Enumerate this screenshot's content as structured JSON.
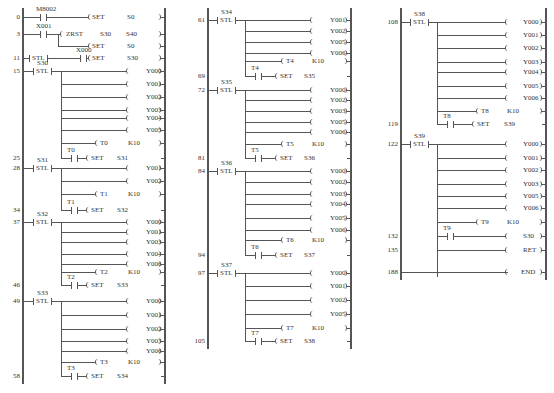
{
  "diagram": {
    "type": "PLC ladder diagram (STL step program)",
    "columns": [
      {
        "rungs": [
          {
            "step": "0",
            "y": 17,
            "contact": {
              "label": "M8002",
              "x": 40
            },
            "coil": "SET",
            "operand": "S0"
          },
          {
            "step": "3",
            "y": 34,
            "contact": {
              "label": "X001",
              "x": 40
            },
            "coil": "ZRST",
            "operand": "S30",
            "operand2": "S40"
          },
          {
            "step": "",
            "y": 46,
            "coil": "SET",
            "operand": "S0",
            "branch": true
          },
          {
            "step": "11",
            "y": 58,
            "stl": {
              "label": ""
            },
            "contact": {
              "label": "X000",
              "x": 80
            },
            "coil": "SET",
            "operand": "S30"
          },
          {
            "step": "15",
            "y": 71,
            "stl": {
              "label": "S30"
            },
            "outputs": [
              "Y000",
              "Y001",
              "Y002",
              "Y003",
              "Y004",
              "Y005"
            ],
            "timer": {
              "name": "T0",
              "k": "K10"
            },
            "transition": {
              "contact": "T0",
              "coil": "SET",
              "operand": "S31"
            },
            "transition_step": "25"
          },
          {
            "step": "28",
            "y": 168,
            "stl": {
              "label": "S31"
            },
            "outputs": [
              "Y001",
              "Y002"
            ],
            "timer": {
              "name": "T1",
              "k": "K10"
            },
            "transition": {
              "contact": "T1",
              "coil": "SET",
              "operand": "S32"
            },
            "transition_step": "34"
          },
          {
            "step": "37",
            "y": 222,
            "stl": {
              "label": "S32"
            },
            "outputs": [
              "Y000",
              "Y001",
              "Y003",
              "Y004",
              "Y006"
            ],
            "timer": {
              "name": "T2",
              "k": "K10"
            },
            "transition": {
              "contact": "T2",
              "coil": "SET",
              "operand": "S33"
            },
            "transition_step": "46"
          },
          {
            "step": "49",
            "y": 301,
            "stl": {
              "label": "S33"
            },
            "outputs": [
              "Y000",
              "Y001",
              "Y002",
              "Y003",
              "Y006"
            ],
            "timer": {
              "name": "T3",
              "k": "K10"
            },
            "transition": {
              "contact": "T3",
              "coil": "SET",
              "operand": "S34"
            },
            "transition_step": "58"
          }
        ]
      },
      {
        "rungs": [
          {
            "step": "61",
            "y": 20,
            "stl": {
              "label": "S34"
            },
            "outputs": [
              "Y001",
              "Y002",
              "Y005",
              "Y006"
            ],
            "timer": {
              "name": "T4",
              "k": "K10"
            },
            "transition": {
              "contact": "T4",
              "coil": "SET",
              "operand": "S35"
            },
            "transition_step": "69"
          },
          {
            "step": "72",
            "y": 90,
            "stl": {
              "label": "S35"
            },
            "outputs": [
              "Y000",
              "Y002",
              "Y003",
              "Y005",
              "Y006"
            ],
            "timer": {
              "name": "T5",
              "k": "K10"
            },
            "transition": {
              "contact": "T5",
              "coil": "SET",
              "operand": "S36"
            },
            "transition_step": "81"
          },
          {
            "step": "84",
            "y": 171,
            "stl": {
              "label": "S36"
            },
            "outputs": [
              "Y000",
              "Y002",
              "Y003",
              "Y004",
              "Y005",
              "Y006"
            ],
            "timer": {
              "name": "T6",
              "k": "K10"
            },
            "transition": {
              "contact": "T6",
              "coil": "SET",
              "operand": "S37"
            },
            "transition_step": "94"
          },
          {
            "step": "97",
            "y": 273,
            "stl": {
              "label": "S37"
            },
            "outputs": [
              "Y000",
              "Y001",
              "Y002",
              "Y005"
            ],
            "timer": {
              "name": "T7",
              "k": "K10"
            },
            "transition": {
              "contact": "T7",
              "coil": "SET",
              "operand": "S38"
            },
            "transition_step": "105"
          }
        ]
      },
      {
        "rungs": [
          {
            "step": "108",
            "y": 22,
            "stl": {
              "label": "S38"
            },
            "outputs": [
              "Y000",
              "Y001",
              "Y002",
              "Y003",
              "Y004",
              "Y005",
              "Y006"
            ],
            "timer": {
              "name": "T8",
              "k": "K10"
            },
            "transition": {
              "contact": "T8",
              "coil": "SET",
              "operand": "S39"
            },
            "transition_step": "119"
          },
          {
            "step": "122",
            "y": 144,
            "stl": {
              "label": "S39"
            },
            "outputs": [
              "Y000",
              "Y001",
              "Y002",
              "Y003",
              "Y005",
              "Y006"
            ],
            "timer": {
              "name": "T9",
              "k": "K10"
            },
            "return_contact": {
              "contact": "T9",
              "coil": "",
              "operand": "S30",
              "step": "132"
            },
            "ret": {
              "label": "RET",
              "step": "135"
            }
          },
          {
            "step": "188",
            "y": 272,
            "end": "END"
          }
        ]
      }
    ]
  },
  "labels": {
    "set": "SET",
    "stl": "STL",
    "zrst": "ZRST",
    "k10": "K10",
    "ret": "RET",
    "end": "END"
  }
}
